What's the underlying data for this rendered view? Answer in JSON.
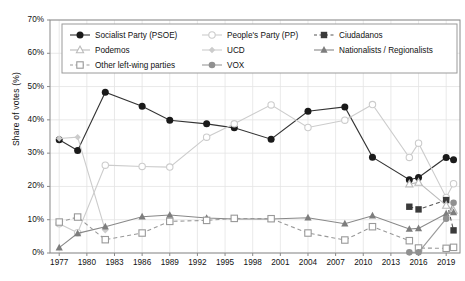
{
  "chart_data": {
    "type": "line",
    "title": "",
    "xlabel": "",
    "ylabel": "Share of votes (%)",
    "xlim": [
      1976,
      2020.5
    ],
    "ylim": [
      0,
      70
    ],
    "ytick_labels": [
      "0%",
      "10%",
      "20%",
      "30%",
      "40%",
      "50%",
      "60%",
      "70%"
    ],
    "ytick_values": [
      0,
      10,
      20,
      30,
      40,
      50,
      60,
      70
    ],
    "xtick_labels": [
      "1977",
      "1980",
      "1983",
      "1986",
      "1989",
      "1992",
      "1995",
      "1998",
      "2001",
      "2004",
      "2007",
      "2010",
      "2013",
      "2016",
      "2019"
    ],
    "xtick_values": [
      1977,
      1980,
      1983,
      1986,
      1989,
      1992,
      1995,
      1998,
      2001,
      2004,
      2007,
      2010,
      2013,
      2016,
      2019
    ],
    "grid": true,
    "legend_position": "top-inside",
    "series": [
      {
        "name": "Socialist Party (PSOE)",
        "marker": "filled-circle",
        "linestyle": "solid",
        "color": "#333333",
        "x": [
          1977,
          1979,
          1982,
          1986,
          1989,
          1993,
          1996,
          2000,
          2004,
          2008,
          2011,
          2015,
          2016,
          2019.0,
          2019.8
        ],
        "y": [
          34.0,
          30.8,
          48.3,
          44.1,
          39.9,
          38.8,
          37.6,
          34.2,
          42.6,
          43.9,
          28.8,
          22.0,
          22.7,
          28.7,
          28.0
        ]
      },
      {
        "name": "People's Party (PP)",
        "marker": "open-circle",
        "linestyle": "solid",
        "color": "#cccccc",
        "x": [
          1977,
          1979,
          1982,
          1986,
          1989,
          1993,
          1996,
          2000,
          2004,
          2008,
          2011,
          2015,
          2016,
          2019.0,
          2019.8
        ],
        "y": [
          8.8,
          6.1,
          26.4,
          26.0,
          25.8,
          34.8,
          38.8,
          44.5,
          37.7,
          39.9,
          44.6,
          28.7,
          33.0,
          16.7,
          20.8
        ]
      },
      {
        "name": "Ciudadanos",
        "marker": "filled-square",
        "linestyle": "dashed",
        "color": "#555555",
        "x": [
          2015,
          2016,
          2019.0,
          2019.8
        ],
        "y": [
          13.9,
          13.1,
          15.9,
          6.8
        ]
      },
      {
        "name": "Podemos",
        "marker": "open-triangle",
        "linestyle": "solid",
        "color": "#bbbbbb",
        "x": [
          2015,
          2016,
          2019.0,
          2019.8
        ],
        "y": [
          20.7,
          21.2,
          14.3,
          12.8
        ]
      },
      {
        "name": "UCD",
        "marker": "small-diamond",
        "linestyle": "solid",
        "color": "#cccccc",
        "x": [
          1977,
          1979,
          1982
        ],
        "y": [
          34.4,
          34.8,
          6.8
        ]
      },
      {
        "name": "Nationalists / Regionalists",
        "marker": "filled-triangle",
        "linestyle": "solid",
        "color": "#888888",
        "x": [
          1977,
          1979,
          1982,
          1986,
          1989,
          1993,
          1996,
          2000,
          2004,
          2008,
          2011,
          2015,
          2016,
          2019.0,
          2019.8
        ],
        "y": [
          1.6,
          5.9,
          7.9,
          10.9,
          11.4,
          10.5,
          10.2,
          10.2,
          10.6,
          8.8,
          11.2,
          7.2,
          7.4,
          11.8,
          12.2
        ]
      },
      {
        "name": "Other left-wing parties",
        "marker": "open-square",
        "linestyle": "dashed",
        "color": "#999999",
        "x": [
          1977,
          1979,
          1982,
          1986,
          1989,
          1993,
          1996,
          2000,
          2004,
          2008,
          2011,
          2015,
          2016,
          2019.0,
          2019.8
        ],
        "y": [
          9.3,
          10.8,
          4.0,
          6.0,
          9.5,
          9.8,
          10.4,
          10.3,
          6.0,
          3.9,
          7.9,
          3.7,
          1.5,
          1.4,
          1.7
        ]
      },
      {
        "name": "VOX",
        "marker": "filled-circle-gray",
        "linestyle": "solid",
        "color": "#9a9a9a",
        "x": [
          2015,
          2016,
          2019.0,
          2019.8
        ],
        "y": [
          0.2,
          0.2,
          10.3,
          15.1
        ]
      }
    ]
  },
  "legend": {
    "items": [
      {
        "label": "Socialist Party (PSOE)"
      },
      {
        "label": "People's Party (PP)"
      },
      {
        "label": "Ciudadanos"
      },
      {
        "label": "Podemos"
      },
      {
        "label": "UCD"
      },
      {
        "label": "Nationalists / Regionalists"
      },
      {
        "label": "Other left-wing parties"
      },
      {
        "label": "VOX"
      }
    ]
  }
}
